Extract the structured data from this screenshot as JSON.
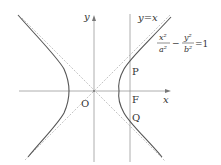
{
  "diagram": {
    "type": "hyperbola",
    "equation": {
      "x_num": "x²",
      "x_den": "a²",
      "minus": "−",
      "y_num": "y²",
      "y_den": "b²",
      "rhs": "=1"
    },
    "labels": {
      "y_axis": "y",
      "x_axis": "x",
      "origin": "O",
      "asymptote": "y=x",
      "point_p": "P",
      "point_f": "F",
      "point_q": "Q"
    },
    "colors": {
      "curve": "#555555",
      "axis": "#9a9a9a",
      "asymptote": "#b0b0b0",
      "text": "#333333"
    }
  }
}
